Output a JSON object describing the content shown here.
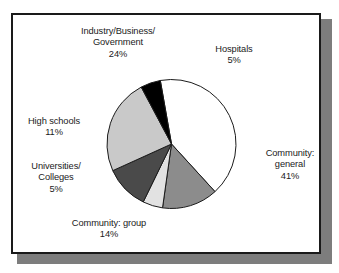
{
  "figure": {
    "background_color": "#ffffff",
    "frame_border_color": "#1a1a1a",
    "shadow_color": "#7d7d7d"
  },
  "chart_data": {
    "type": "pie",
    "title": "",
    "subtitle": "",
    "xlabel": "",
    "ylabel": "",
    "legend_position": "none",
    "grid": false,
    "units": "percent",
    "total": 100,
    "start_angle_deg": -10,
    "direction": "clockwise",
    "categories": [
      "Community: general",
      "Community: group",
      "Universities/Colleges",
      "High schools",
      "Industry/Business/Government",
      "Hospitals"
    ],
    "values": [
      41,
      14,
      5,
      11,
      24,
      5
    ],
    "slices": [
      {
        "name": "Community: general",
        "label_lines": [
          "Community:",
          "general",
          "41%"
        ],
        "label_text": "Community:\ngeneral\n41%",
        "value": 41,
        "percent": "41%",
        "color": "#ffffff",
        "stroke": "#1b1b1b"
      },
      {
        "name": "Community: group",
        "label_lines": [
          "Community: group",
          "14%"
        ],
        "label_text": "Community: group\n14%",
        "value": 14,
        "percent": "14%",
        "color": "#8c8c8c",
        "stroke": "#1b1b1b"
      },
      {
        "name": "Universities/Colleges",
        "label_lines": [
          "Universities/",
          "Colleges",
          "5%"
        ],
        "label_text": "Universities/\nColleges\n5%",
        "value": 5,
        "percent": "5%",
        "color": "#e2e2e2",
        "stroke": "#1b1b1b"
      },
      {
        "name": "High schools",
        "label_lines": [
          "High schools",
          "11%"
        ],
        "label_text": "High schools\n11%",
        "value": 11,
        "percent": "11%",
        "color": "#4a4a4a",
        "stroke": "#1b1b1b"
      },
      {
        "name": "Industry/Business/Government",
        "label_lines": [
          "Industry/Business/",
          "Government",
          "24%"
        ],
        "label_text": "Industry/Business/\nGovernment\n24%",
        "value": 24,
        "percent": "24%",
        "color": "#c9c9c9",
        "stroke": "#1b1b1b"
      },
      {
        "name": "Hospitals",
        "label_lines": [
          "Hospitals",
          "5%"
        ],
        "label_text": "Hospitals\n5%",
        "value": 5,
        "percent": "5%",
        "color": "#000000",
        "stroke": "#1b1b1b"
      }
    ]
  }
}
